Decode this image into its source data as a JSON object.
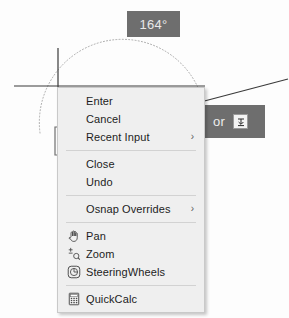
{
  "app": {
    "kind": "autocad-dynamic-input-context-menu"
  },
  "drawing": {
    "angle_tooltip": {
      "value": "164°",
      "background": "#6e6e6e",
      "text_color": "#e8e8e8"
    },
    "alternate_tooltip": {
      "label": "or",
      "button_icon": "dynamic-input-dropdown-icon",
      "background": "#6e6e6e",
      "text_color": "#ededed"
    },
    "cursor": "crosshair-cursor",
    "arc": "dotted-angle-arc",
    "rubber_band_line": "rubber-band-line",
    "base_line": "horizontal-base-line"
  },
  "context_menu": {
    "background": "#efefef",
    "border_color": "#c9c9c9",
    "groups": [
      {
        "items": [
          {
            "label": "Enter",
            "icon": null,
            "submenu": false
          },
          {
            "label": "Cancel",
            "icon": null,
            "submenu": false
          },
          {
            "label": "Recent Input",
            "icon": null,
            "submenu": true,
            "arrow": "›"
          }
        ]
      },
      {
        "items": [
          {
            "label": "Close",
            "icon": null,
            "submenu": false
          },
          {
            "label": "Undo",
            "icon": null,
            "submenu": false
          }
        ]
      },
      {
        "items": [
          {
            "label": "Osnap Overrides",
            "icon": null,
            "submenu": true,
            "arrow": "›"
          }
        ]
      },
      {
        "items": [
          {
            "label": "Pan",
            "icon": "hand-icon",
            "submenu": false
          },
          {
            "label": "Zoom",
            "icon": "zoom-magnifier-icon",
            "submenu": false
          },
          {
            "label": "SteeringWheels",
            "icon": "steering-wheel-icon",
            "submenu": false
          }
        ]
      },
      {
        "items": [
          {
            "label": "QuickCalc",
            "icon": "calculator-icon",
            "submenu": false
          }
        ]
      }
    ]
  }
}
